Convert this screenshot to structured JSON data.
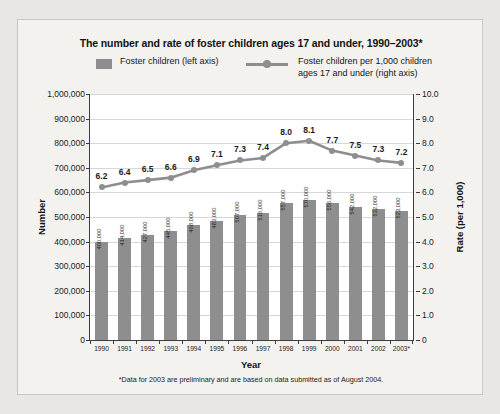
{
  "chart_data": {
    "type": "bar",
    "title": "The number and rate of foster children ages 17 and under, 1990–2003*",
    "xlabel": "Year",
    "ylabel": "Number",
    "y2label": "Rate (per 1,000)",
    "categories": [
      "1990",
      "1991",
      "1992",
      "1993",
      "1994",
      "1995",
      "1996",
      "1997",
      "1998",
      "1999",
      "2000",
      "2001",
      "2002",
      "2003*"
    ],
    "ylim": [
      0,
      1000000
    ],
    "y2lim": [
      0,
      10
    ],
    "grid": true,
    "legend_position": "top-center",
    "series": [
      {
        "name": "Foster children (left axis)",
        "type": "bar",
        "axis": "left",
        "color": "#8e8e8e",
        "values": [
          400000,
          414000,
          427000,
          445000,
          468000,
          483000,
          507000,
          516000,
          557000,
          570000,
          556000,
          542000,
          532000,
          523000
        ],
        "value_labels": [
          "400,000",
          "414,000",
          "427,000",
          "445,000",
          "468,000",
          "483,000",
          "507,000",
          "516,000",
          "557,000",
          "570,000",
          "556,000",
          "542,000",
          "532,000",
          "523,000"
        ]
      },
      {
        "name": "Foster children per 1,000 children ages 17 and under (right axis)",
        "type": "line",
        "axis": "right",
        "color": "#8e8e8e",
        "values": [
          6.2,
          6.4,
          6.5,
          6.6,
          6.9,
          7.1,
          7.3,
          7.4,
          8.0,
          8.1,
          7.7,
          7.5,
          7.3,
          7.2
        ],
        "value_labels": [
          "6.2",
          "6.4",
          "6.5",
          "6.6",
          "6.9",
          "7.1",
          "7.3",
          "7.4",
          "8.0",
          "8.1",
          "7.7",
          "7.5",
          "7.3",
          "7.2"
        ]
      }
    ],
    "ytick_labels": [
      "1,000,000",
      "900,000",
      "800,000",
      "700,000",
      "600,000",
      "500,000",
      "400,000",
      "300,000",
      "200,000",
      "100,000",
      "0"
    ],
    "ytick_values": [
      1000000,
      900000,
      800000,
      700000,
      600000,
      500000,
      400000,
      300000,
      200000,
      100000,
      0
    ],
    "y2tick_labels": [
      "10.0",
      "9.0",
      "8.0",
      "7.0",
      "6.0",
      "5.0",
      "4.0",
      "3.0",
      "2.0",
      "1.0",
      "0"
    ],
    "y2tick_values": [
      10,
      9,
      8,
      7,
      6,
      5,
      4,
      3,
      2,
      1,
      0
    ],
    "annotations": [
      "*Data for 2003 are preliminary and are based on data submitted as of August 2004."
    ]
  },
  "legend": {
    "item1_label": "Foster children (left axis)",
    "item2_line1": "Foster children per 1,000 children",
    "item2_line2": "ages 17 and under (right axis)"
  },
  "footnote": "*Data for 2003 are preliminary and are based on data submitted as of August 2004.",
  "colors": {
    "bar": "#8e8e8e",
    "line": "#8e8e8e",
    "axis": "#3d3d3d",
    "grid": "#d7d7d7",
    "panel_bg": "#f3f2ef",
    "page_bg": "#e9e7e4",
    "plot_bg": "#ffffff"
  }
}
